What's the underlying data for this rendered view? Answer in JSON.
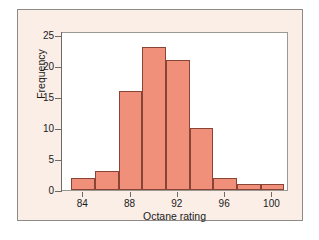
{
  "chart_data": {
    "type": "bar",
    "title": "",
    "subtitle": "",
    "xlabel": "Octane rating",
    "ylabel": "Frequency",
    "xlim": [
      82.2,
      101.4
    ],
    "ylim": [
      0,
      25.6
    ],
    "grid": false,
    "legend": null,
    "bin_width": 2,
    "bin_edges": [
      83,
      85,
      87,
      89,
      91,
      93,
      95,
      97,
      99,
      101
    ],
    "categories": [
      "83-85",
      "85-87",
      "87-89",
      "89-91",
      "91-93",
      "93-95",
      "95-97",
      "97-99",
      "99-101"
    ],
    "values": [
      2,
      3,
      16,
      23,
      21,
      10,
      2,
      1,
      1
    ],
    "bin_centers": [
      84,
      86,
      88,
      90,
      92,
      94,
      96,
      98,
      100
    ],
    "x_ticks": [
      84,
      88,
      92,
      96,
      100
    ],
    "x_tick_labels": [
      "84",
      "88",
      "92",
      "96",
      "100"
    ],
    "y_ticks": [
      0,
      5,
      10,
      15,
      20,
      25
    ],
    "y_tick_labels": [
      "0",
      "5",
      "10",
      "15",
      "20",
      "25"
    ],
    "colors": {
      "bar_fill": "#f0907a",
      "bar_edge": "#8a4436",
      "plot_background": "#ffffff",
      "panel_background": "#faeee7",
      "axis": "#6e6a67",
      "text": "#1b1b1b"
    }
  }
}
